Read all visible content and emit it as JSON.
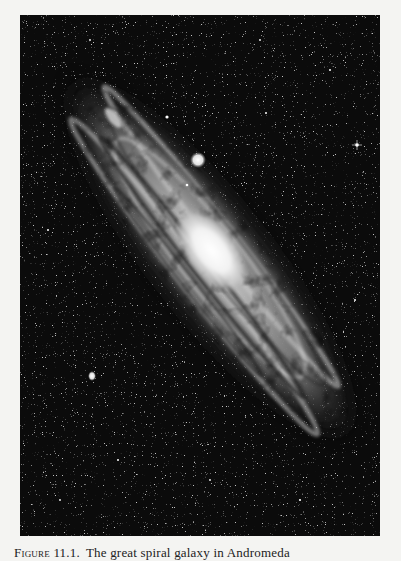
{
  "figure": {
    "label": "Figure 11.1.",
    "caption_text": "The great spiral galaxy in Andromeda",
    "colors": {
      "page": "#f4f4f2",
      "sky": "#0b0b0b",
      "core": "#ffffff",
      "arms": "#bdbdbd",
      "dust": "#2a2a2a"
    },
    "features": {
      "core_center": [
        205,
        255
      ],
      "companion_large": [
        198,
        160
      ],
      "companion_small": [
        92,
        375
      ],
      "bright_star": [
        357,
        145
      ]
    }
  }
}
